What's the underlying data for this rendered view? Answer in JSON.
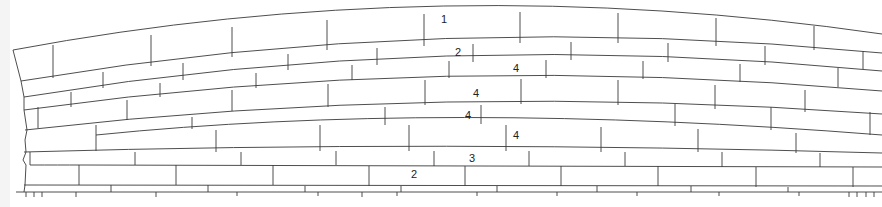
{
  "diagram": {
    "type": "masonry-elevation",
    "stroke_color": "#3a3a3a",
    "background": "#ffffff",
    "course_labels": [
      {
        "text": "1",
        "x": 441,
        "y": 23
      },
      {
        "text": "2",
        "x": 455,
        "y": 56
      },
      {
        "text": "4",
        "x": 513,
        "y": 72
      },
      {
        "text": "4",
        "x": 473,
        "y": 97
      },
      {
        "text": "4",
        "x": 465,
        "y": 119
      },
      {
        "text": "4",
        "x": 513,
        "y": 139
      },
      {
        "text": "3",
        "x": 469,
        "y": 162
      },
      {
        "text": "2",
        "x": 411,
        "y": 178
      }
    ],
    "courses": [
      {
        "id": 1,
        "label": "1"
      },
      {
        "id": 2,
        "label": "2"
      },
      {
        "id": 3,
        "label": "4"
      },
      {
        "id": 4,
        "label": "4"
      },
      {
        "id": 5,
        "label": "4"
      },
      {
        "id": 6,
        "label": "4"
      },
      {
        "id": 7,
        "label": "3"
      },
      {
        "id": 8,
        "label": "2"
      }
    ]
  }
}
